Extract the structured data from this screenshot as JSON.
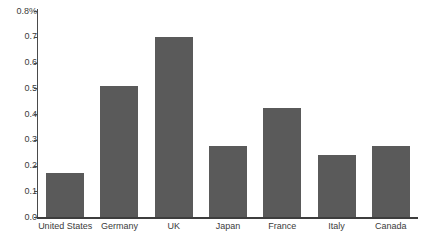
{
  "chart_data": {
    "type": "bar",
    "title": "",
    "subtitle": "",
    "xlabel": "",
    "ylabel": "",
    "categories": [
      "United States",
      "Germany",
      "UK",
      "Japan",
      "France",
      "Italy",
      "Canada"
    ],
    "values": [
      0.17,
      0.51,
      0.7,
      0.275,
      0.425,
      0.24,
      0.275
    ],
    "series": [
      {
        "name": "",
        "values": [
          0.17,
          0.51,
          0.7,
          0.275,
          0.425,
          0.24,
          0.275
        ]
      }
    ],
    "ylim": [
      0.0,
      0.8
    ],
    "ytick_values": [
      0.0,
      0.1,
      0.2,
      0.3,
      0.4,
      0.5,
      0.6,
      0.7,
      0.8
    ],
    "ytick_labels": [
      "0.0",
      "0.1",
      "0.2",
      "0.3",
      "0.4",
      "0.5",
      "0.6",
      "0.7",
      "0.8%"
    ],
    "unit": "%",
    "grid": false,
    "legend": false,
    "legend_position": "none",
    "bar_color": "#5a5a5a",
    "axis_color": "#4a4a4a",
    "background_color": "#ffffff"
  }
}
